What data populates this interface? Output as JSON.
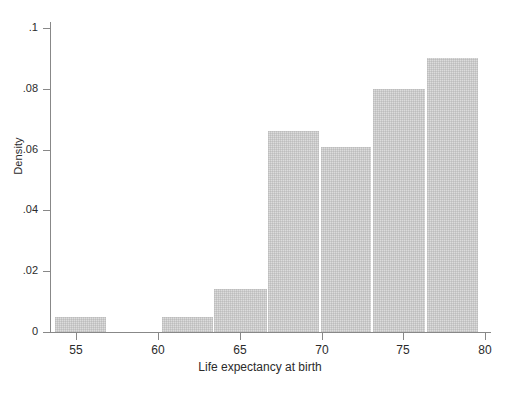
{
  "chart": {
    "type": "bar",
    "title": "",
    "xlabel": "Life expectancy at birth",
    "ylabel": "Density"
  },
  "axes": {
    "x_ticks": [
      "55",
      "60",
      "65",
      "70",
      "75",
      "80"
    ],
    "y_ticks": [
      "0",
      ".02",
      ".04",
      ".06",
      ".08",
      ".1"
    ]
  },
  "chart_data": {
    "type": "bar",
    "title": "",
    "subtitle": "",
    "xlabel": "Life expectancy at birth",
    "ylabel": "Density",
    "xlim": [
      53.5,
      80.5
    ],
    "ylim": [
      0,
      0.1
    ],
    "grid": false,
    "legend": null,
    "bin_width": 3.25,
    "categories": [
      "53.7-56.9",
      "60.2-63.4",
      "63.4-66.7",
      "66.7-69.9",
      "69.9-73.1",
      "73.1-76.4",
      "76.4-79.6"
    ],
    "bin_edges": [
      53.7,
      56.9,
      60.2,
      63.4,
      66.7,
      69.9,
      73.1,
      76.4,
      79.6
    ],
    "values": [
      0.005,
      0.005,
      0.014,
      0.066,
      0.061,
      0.08,
      0.09
    ],
    "bars": [
      {
        "label": "53.7-56.9",
        "x0": 53.7,
        "x1": 56.9,
        "value": 0.005
      },
      {
        "label": "60.2-63.4",
        "x0": 60.2,
        "x1": 63.4,
        "value": 0.005
      },
      {
        "label": "63.4-66.7",
        "x0": 63.4,
        "x1": 66.7,
        "value": 0.014
      },
      {
        "label": "66.7-69.9",
        "x0": 66.7,
        "x1": 69.9,
        "value": 0.066
      },
      {
        "label": "69.9-73.1",
        "x0": 69.9,
        "x1": 73.1,
        "value": 0.061
      },
      {
        "label": "73.1-76.4",
        "x0": 73.1,
        "x1": 76.4,
        "value": 0.08
      },
      {
        "label": "76.4-79.6",
        "x0": 76.4,
        "x1": 79.6,
        "value": 0.09
      }
    ],
    "xticks": [
      55,
      60,
      65,
      70,
      75,
      80
    ],
    "xticklabels": [
      "55",
      "60",
      "65",
      "70",
      "75",
      "80"
    ],
    "yticks": [
      0,
      0.02,
      0.04,
      0.06,
      0.08,
      0.1
    ],
    "yticklabels": [
      "0",
      ".02",
      ".04",
      ".06",
      ".08",
      ".1"
    ]
  },
  "colors": {
    "bar_fill": "#dcdcdc",
    "axis": "#888888",
    "text": "#2b2b2b",
    "background": "#ffffff"
  }
}
